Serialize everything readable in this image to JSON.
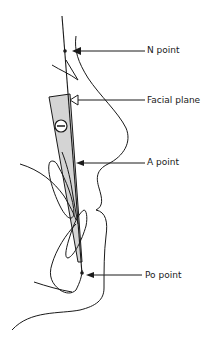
{
  "figure": {
    "type": "cephalometric-tracing",
    "angle_sign": "−",
    "colors": {
      "line": "#1a1a1a",
      "shade": "#d4d4d4",
      "background": "#ffffff"
    }
  },
  "labels": [
    {
      "id": "n_point",
      "text": "N point",
      "x": 147,
      "y": 46
    },
    {
      "id": "facial_plane",
      "text": "Facial plane",
      "x": 147,
      "y": 96
    },
    {
      "id": "a_point",
      "text": "A point",
      "x": 147,
      "y": 158
    },
    {
      "id": "po_point",
      "text": "Po point",
      "x": 145,
      "y": 271
    }
  ]
}
